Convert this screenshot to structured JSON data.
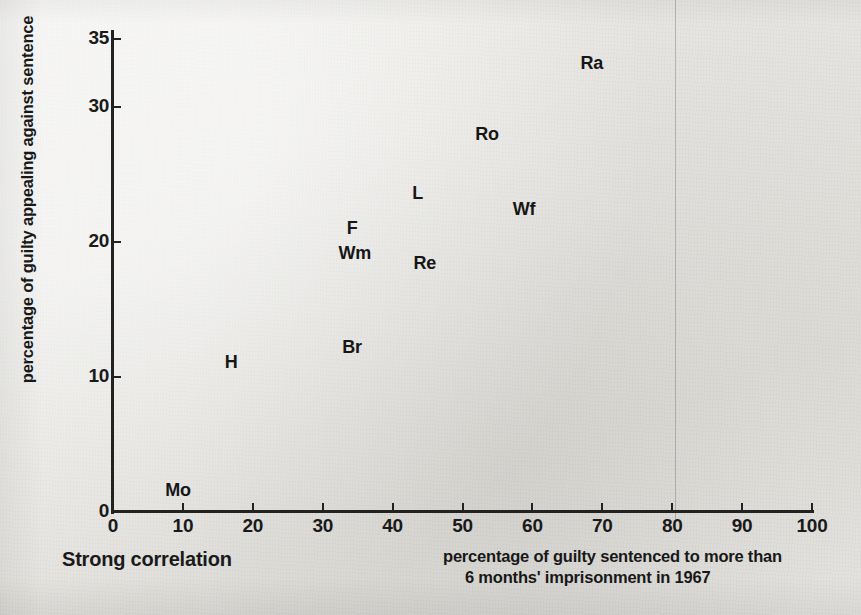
{
  "chart_data": {
    "type": "scatter",
    "title": "Strong correlation",
    "xlabel_line1": "percentage of guilty sentenced to more than",
    "xlabel_line2": "6 months' imprisonment in 1967",
    "ylabel": "percentage of guilty appealing against sentence",
    "xlim": [
      0,
      100
    ],
    "ylim": [
      0,
      35
    ],
    "xticks": [
      0,
      10,
      20,
      30,
      40,
      50,
      60,
      70,
      80,
      90,
      100
    ],
    "yticks": [
      0,
      10,
      20,
      30,
      35
    ],
    "grid": false,
    "legend": "none",
    "point_style": "text-label",
    "points": [
      {
        "label": "Ra",
        "x": 68.5,
        "y": 33.2
      },
      {
        "label": "Ro",
        "x": 53.5,
        "y": 28.0
      },
      {
        "label": "L",
        "x": 43.6,
        "y": 23.6
      },
      {
        "label": "Wf",
        "x": 58.8,
        "y": 22.4
      },
      {
        "label": "F",
        "x": 34.2,
        "y": 21.0
      },
      {
        "label": "Wm",
        "x": 34.6,
        "y": 19.2
      },
      {
        "label": "Re",
        "x": 44.6,
        "y": 18.4
      },
      {
        "label": "Br",
        "x": 34.2,
        "y": 12.2
      },
      {
        "label": "H",
        "x": 16.9,
        "y": 11.1
      },
      {
        "label": "Mo",
        "x": 9.3,
        "y": 1.6
      }
    ]
  },
  "colors": {
    "paper": "#e8e7e3",
    "ink": "#1a1a1a",
    "axis": "#222222"
  }
}
